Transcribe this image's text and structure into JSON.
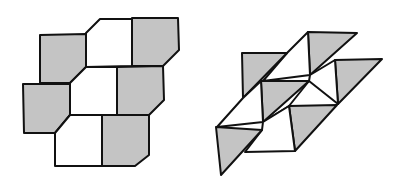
{
  "figure": {
    "colors": {
      "gray": "#c4c4c4",
      "white": "#ffffff",
      "stroke": "#111111"
    },
    "left_tiling": {
      "tiles": [
        {
          "fill": "white",
          "points": "100,19 132,19 132,66 86,67 86,33"
        },
        {
          "fill": "gray",
          "points": "132,18 178,18 179,50 163,66 132,66"
        },
        {
          "fill": "gray",
          "points": "40,35 86,34 86,67 86,67 70,83 40,83"
        },
        {
          "fill": "white",
          "points": "86,67 117,67 117,115 70,115 70,83"
        },
        {
          "fill": "gray",
          "points": "117,67 163,66 164,100 149,115 117,115"
        },
        {
          "fill": "gray",
          "points": "23,84 70,84 70,115 55,133 24,133"
        },
        {
          "fill": "white",
          "points": "55,133 70,115 102,115 102,166 55,166"
        },
        {
          "fill": "gray",
          "points": "102,115 149,115 149,155 135,166 102,166"
        }
      ]
    },
    "right_tiling": {
      "tiles": [
        {
          "fill": "gray",
          "points": "308,32 357,33 310,75"
        },
        {
          "fill": "white",
          "points": "308,32 310,75 263,81 287,53"
        },
        {
          "fill": "gray",
          "points": "242,53 287,53 243,98"
        },
        {
          "fill": "gray",
          "points": "335,60 382,59 338,104"
        },
        {
          "fill": "white",
          "points": "310,75 335,60 338,104 309,81"
        },
        {
          "fill": "white",
          "points": "263,81 309,81 289,106 263,122"
        },
        {
          "fill": "gray",
          "points": "261,81 309,81 263,122"
        },
        {
          "fill": "white",
          "points": "243,98 261,81 263,122 217,127"
        },
        {
          "fill": "gray",
          "points": "289,106 337,105 295,151"
        },
        {
          "fill": "white",
          "points": "263,122 289,106 295,151 245,152 262,130"
        },
        {
          "fill": "gray",
          "points": "216,127 262,130 221,175"
        }
      ]
    }
  }
}
